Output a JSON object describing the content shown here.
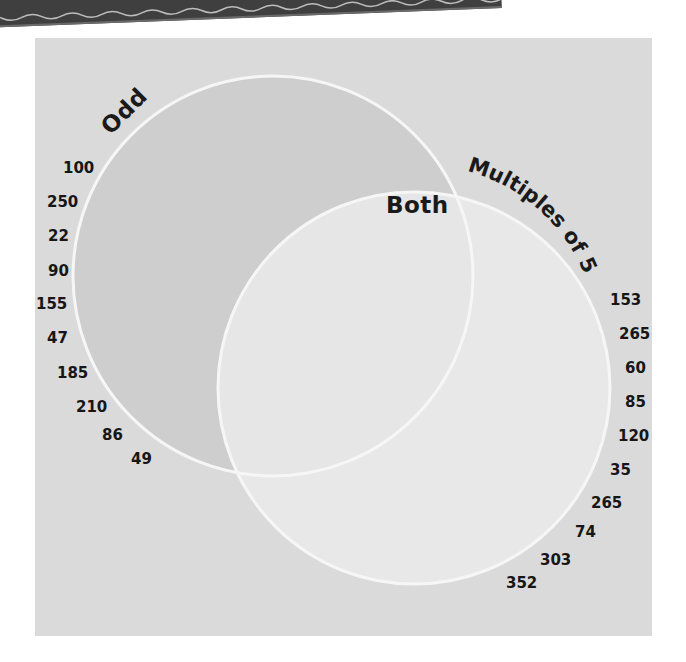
{
  "banner": {
    "text": "counted by ...",
    "color": "#3f3f3f"
  },
  "diagram": {
    "type": "venn",
    "background_color": "#dadada",
    "sets": [
      {
        "id": "odd",
        "label": "Odd",
        "fill": "#cfcfcf",
        "stroke": "#f4f4f4",
        "numbers": [
          "100",
          "250",
          "22",
          "90",
          "155",
          "47",
          "185",
          "210",
          "86",
          "49"
        ]
      },
      {
        "id": "multiples-of-5",
        "label": "Multiples of 5",
        "fill": "#e8e8e8",
        "stroke": "#f4f4f4",
        "numbers": [
          "153",
          "265",
          "60",
          "85",
          "120",
          "35",
          "265",
          "74",
          "303",
          "352"
        ]
      }
    ],
    "intersection": {
      "label": "Both"
    }
  }
}
